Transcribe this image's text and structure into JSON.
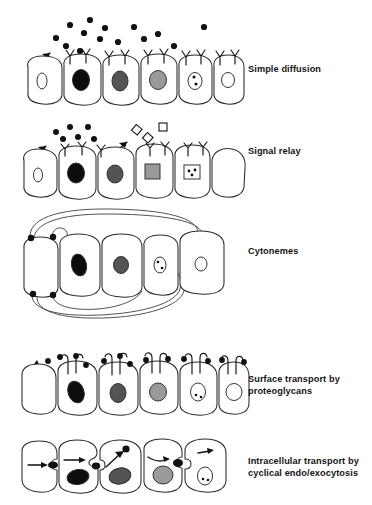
{
  "figure": {
    "caption": "",
    "colors": {
      "ink": "#2b2b2b",
      "label_text": "#141414",
      "nucleus_black": "#0d0d0d",
      "nucleus_dark_gray": "#545454",
      "nucleus_mid_gray": "#8f8f8f",
      "nucleus_light_gray": "#a8a8a8",
      "nucleus_white": "#ffffff",
      "background": "#ffffff"
    }
  },
  "panels": [
    {
      "id": "simple-diffusion",
      "label": "Simple diffusion",
      "top": 8,
      "label_top": 64,
      "signal_shape": "filled-circle",
      "free_ligands": [
        {
          "x": 48,
          "y": 30,
          "r": 3.1
        },
        {
          "x": 62,
          "y": 17,
          "r": 3.1
        },
        {
          "x": 75,
          "y": 25,
          "r": 3.1
        },
        {
          "x": 58,
          "y": 38,
          "r": 3.1
        },
        {
          "x": 82,
          "y": 12,
          "r": 3.1
        },
        {
          "x": 92,
          "y": 31,
          "r": 3.1
        },
        {
          "x": 72,
          "y": 42,
          "r": 3.1
        },
        {
          "x": 96,
          "y": 20,
          "r": 3.1
        },
        {
          "x": 110,
          "y": 33,
          "r": 3.1
        },
        {
          "x": 126,
          "y": 19,
          "r": 3.1
        },
        {
          "x": 134,
          "y": 31,
          "r": 3.1
        },
        {
          "x": 150,
          "y": 26,
          "r": 3.1
        },
        {
          "x": 164,
          "y": 38,
          "r": 3.1
        },
        {
          "x": 196,
          "y": 19,
          "r": 3.1
        }
      ],
      "cells": [
        {
          "nucleus": "small-open-oval",
          "receptors": 0
        },
        {
          "nucleus": "black",
          "receptors": 2
        },
        {
          "nucleus": "dark-gray",
          "receptors": 2
        },
        {
          "nucleus": "mid-gray",
          "receptors": 2
        },
        {
          "nucleus": "dotted-open",
          "receptors": 2
        },
        {
          "nucleus": "white-open",
          "receptors": 2
        }
      ],
      "has_uptake_arrow": true
    },
    {
      "id": "signal-relay",
      "label": "Signal relay",
      "top": 113,
      "label_top": 146,
      "signal_shape": "filled-circle",
      "secondary_shape": "open-square",
      "free_ligands": [
        {
          "x": 48,
          "y": 26,
          "r": 3.0
        },
        {
          "x": 62,
          "y": 18,
          "r": 3.0
        },
        {
          "x": 57,
          "y": 32,
          "r": 3.0
        },
        {
          "x": 72,
          "y": 27,
          "r": 3.0
        },
        {
          "x": 80,
          "y": 17,
          "r": 3.0
        },
        {
          "x": 88,
          "y": 29,
          "r": 3.0
        }
      ],
      "free_squares": [
        {
          "x": 129,
          "y": 20,
          "size": 7,
          "rotate": 38
        },
        {
          "x": 140,
          "y": 28,
          "size": 7,
          "rotate": 40
        },
        {
          "x": 153,
          "y": 16,
          "size": 7,
          "rotate": 0
        }
      ],
      "cells": [
        {
          "nucleus": "small-open-oval",
          "receptors": 0
        },
        {
          "nucleus": "black",
          "receptors": 2
        },
        {
          "nucleus": "dark-gray",
          "receptors": 1
        },
        {
          "nucleus": "gray-square",
          "receptors": 2
        },
        {
          "nucleus": "dotted-square",
          "receptors": 2
        },
        {
          "nucleus": "none",
          "receptors": 0
        }
      ],
      "has_uptake_arrow": true,
      "has_relay_arrow": true
    },
    {
      "id": "cytonemes",
      "label": "Cytonemes",
      "top": 205,
      "label_top": 246,
      "cells": [
        {
          "nucleus": "none",
          "receptors": 0
        },
        {
          "nucleus": "black",
          "receptors": 0
        },
        {
          "nucleus": "dark-gray",
          "receptors": 0
        },
        {
          "nucleus": "dotted-open",
          "receptors": 0
        },
        {
          "nucleus": "white-open",
          "receptors": 0
        }
      ],
      "contact_points": [
        {
          "x": 24,
          "y": 31
        },
        {
          "x": 44,
          "y": 31
        },
        {
          "x": 24,
          "y": 88
        },
        {
          "x": 44,
          "y": 88
        }
      ],
      "cytoneme_count": 5
    },
    {
      "id": "surface-transport",
      "label": "Surface transport by\nproteoglycans",
      "top": 345,
      "label_top": 374,
      "signal_shape": "filled-circle",
      "cells": [
        {
          "nucleus": "none",
          "receptors": 0
        },
        {
          "nucleus": "black",
          "receptors": 1
        },
        {
          "nucleus": "dark-gray",
          "receptors": 1
        },
        {
          "nucleus": "mid-gray",
          "receptors": 1
        },
        {
          "nucleus": "dotted-open",
          "receptors": 1
        },
        {
          "nucleus": "white-open",
          "receptors": 1
        }
      ],
      "surface_ligands": [
        {
          "x": 40,
          "y": 16
        },
        {
          "x": 52,
          "y": 12
        },
        {
          "x": 68,
          "y": 12
        },
        {
          "x": 76,
          "y": 20
        },
        {
          "x": 96,
          "y": 16
        },
        {
          "x": 112,
          "y": 16
        },
        {
          "x": 124,
          "y": 16
        },
        {
          "x": 140,
          "y": 16
        },
        {
          "x": 160,
          "y": 14
        },
        {
          "x": 176,
          "y": 14
        },
        {
          "x": 190,
          "y": 16
        },
        {
          "x": 206,
          "y": 14
        }
      ],
      "has_uptake_arrow": true
    },
    {
      "id": "intracellular-transport",
      "label": "Intracellular transport by\ncyclical endo/exocytosis",
      "top": 437,
      "label_top": 456,
      "signal_shape": "filled-vesicle",
      "cells": [
        {
          "nucleus": "none",
          "receptors": 0
        },
        {
          "nucleus": "black",
          "receptors": 0
        },
        {
          "nucleus": "dark-gray",
          "receptors": 0
        },
        {
          "nucleus": "mid-gray",
          "receptors": 0
        },
        {
          "nucleus": "dotted-open",
          "receptors": 0
        }
      ],
      "vesicles": [
        {
          "x": 42,
          "y": 32
        },
        {
          "x": 88,
          "y": 34
        },
        {
          "x": 106,
          "y": 20
        },
        {
          "x": 158,
          "y": 22
        }
      ],
      "internal_arrows": 5
    }
  ]
}
